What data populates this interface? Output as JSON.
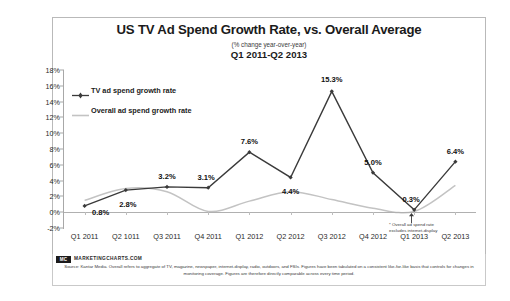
{
  "header": {
    "title": "US TV Ad Spend Growth Rate, vs. Overall Average",
    "subtitle": "(% change year-over-year)",
    "period": "Q1 2011-Q2 2013"
  },
  "footnote": {
    "line1": "* Overall ad spend rate",
    "line2": "excludes internet-display"
  },
  "source": {
    "badge": "MC",
    "url": "MARKETINGCHARTS.COM",
    "text": "Source: Kantar Media. Overall refers to aggregate of TV, magazine, newspaper, internet-display, radio, outdoors, and FSIs. Figures have been tabulated on a consistent like-for-like basis that controls for changes in monitoring coverage. Figures are therefore directly comparable across every time period."
  },
  "colors": {
    "tv_line": "#3a3a3a",
    "overall_line": "#c3c3c3",
    "axis": "#a8a8a8",
    "text": "#1b1b1b"
  },
  "chart_data": {
    "type": "line",
    "title": "US TV Ad Spend Growth Rate, vs. Overall Average",
    "subtitle": "(% change year-over-year)",
    "xlabel": "",
    "ylabel": "",
    "ylim": [
      -2,
      18
    ],
    "ytick_step": 2,
    "ytick_labels": [
      "18%",
      "16%",
      "14%",
      "12%",
      "10%",
      "8%",
      "6%",
      "4%",
      "2%",
      "0%",
      "-2%"
    ],
    "ytick_values": [
      18,
      16,
      14,
      12,
      10,
      8,
      6,
      4,
      2,
      0,
      -2
    ],
    "grid": false,
    "legend_position": "top-left",
    "categories": [
      "Q1 2011",
      "Q2 1011",
      "Q3 2011",
      "Q4 2011",
      "Q1 2012",
      "Q2 2012",
      "Q3 2012",
      "Q4 2012",
      "Q1 2013",
      "Q2 2013"
    ],
    "series": [
      {
        "name": "TV ad spend growth rate",
        "color": "#3a3a3a",
        "values": [
          0.8,
          2.8,
          3.2,
          3.1,
          7.6,
          4.4,
          15.3,
          5.0,
          0.3,
          6.4
        ],
        "data_labels": [
          "0.8%",
          "2.8%",
          "3.2%",
          "3.1%",
          "7.6%",
          "4.4%",
          "15.3%",
          "5.0%",
          "0.3%",
          "6.4%"
        ]
      },
      {
        "name": "Overall ad spend growth rate",
        "color": "#c3c3c3",
        "values": [
          1.5,
          3.0,
          2.6,
          0.1,
          1.4,
          2.6,
          1.6,
          0.5,
          0.1,
          3.4
        ],
        "data_labels": []
      }
    ],
    "annotations": [
      "* Overall ad spend rate excludes internet-display"
    ]
  }
}
